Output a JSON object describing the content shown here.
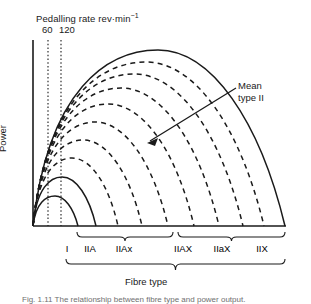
{
  "figure": {
    "pedalling_rate_title": "Pedalling rate rev·min",
    "pedalling_rate_exponent": "−1",
    "y_axis_label": "Power",
    "x_axis_label": "Fibre type",
    "annotation_line1": "Mean",
    "annotation_line2": "type II",
    "caption": "Fig. 1.11  The relationship between fibre type and power output."
  },
  "ticks": [
    {
      "label": "60",
      "x": 48
    },
    {
      "label": "120",
      "x": 61
    }
  ],
  "fibre_types": [
    {
      "label": "I",
      "x": 67
    },
    {
      "label": "IIA",
      "x": 90
    },
    {
      "label": "IIAx",
      "x": 124
    },
    {
      "label": "IIAX",
      "x": 183
    },
    {
      "label": "IIaX",
      "x": 222
    },
    {
      "label": "IIX",
      "x": 262
    }
  ],
  "braces": [
    {
      "name": "left-brace",
      "x1": 77,
      "x2": 173
    },
    {
      "name": "right-brace",
      "x1": 178,
      "x2": 285
    },
    {
      "name": "full-brace",
      "x1": 66,
      "x2": 285
    }
  ],
  "chart_data": {
    "type": "line",
    "title": "",
    "xlabel": "Fibre type",
    "ylabel": "Power",
    "grid": false,
    "legend": null,
    "x_reference_lines": [
      60,
      120
    ],
    "x_reference_unit": "rev·min⁻¹",
    "curves": [
      {
        "name": "type-I-innermost",
        "style": "solid",
        "peak_x": 55,
        "peak_y": 196,
        "end_x": 78
      },
      {
        "name": "curve-2",
        "style": "solid",
        "peak_x": 62,
        "peak_y": 177,
        "end_x": 96
      },
      {
        "name": "curve-3",
        "style": "dashed",
        "peak_x": 72,
        "peak_y": 158,
        "end_x": 118
      },
      {
        "name": "curve-4",
        "style": "dashed",
        "peak_x": 83,
        "peak_y": 140,
        "end_x": 142
      },
      {
        "name": "curve-5",
        "style": "dashed",
        "peak_x": 95,
        "peak_y": 122,
        "end_x": 168
      },
      {
        "name": "curve-6",
        "style": "dashed",
        "peak_x": 108,
        "peak_y": 104,
        "end_x": 194
      },
      {
        "name": "curve-7",
        "style": "dashed",
        "peak_x": 121,
        "peak_y": 88,
        "end_x": 219
      },
      {
        "name": "curve-8",
        "style": "dashed",
        "peak_x": 134,
        "peak_y": 74,
        "end_x": 243
      },
      {
        "name": "curve-9",
        "style": "dashed",
        "peak_x": 146,
        "peak_y": 62,
        "end_x": 264
      },
      {
        "name": "type-IIX-outermost",
        "style": "solid",
        "peak_x": 158,
        "peak_y": 50,
        "end_x": 285
      }
    ],
    "axes": {
      "origin_x": 33,
      "baseline_y": 226,
      "top_y": 40
    }
  }
}
